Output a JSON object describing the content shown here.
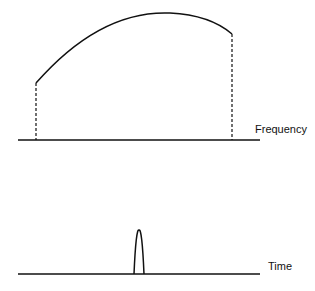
{
  "diagram": {
    "type": "frequency-time-duality",
    "panels": [
      {
        "name": "frequency-domain",
        "axis_label": "Frequency",
        "description": "Broad spectrum curve bounded by dashed vertical lines"
      },
      {
        "name": "time-domain",
        "axis_label": "Time",
        "description": "Narrow pulse on the time axis"
      }
    ],
    "colors": {
      "stroke": "#111111",
      "background": "#ffffff"
    }
  }
}
